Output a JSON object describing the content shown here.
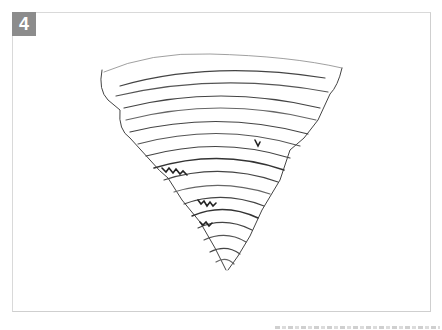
{
  "step": {
    "number": "4",
    "badge_color": "#8c8c8c"
  },
  "illustration": {
    "subject": "pencil sketch of a tornado funnel",
    "stroke_color": "#333333"
  },
  "watermark": {
    "text": ""
  }
}
